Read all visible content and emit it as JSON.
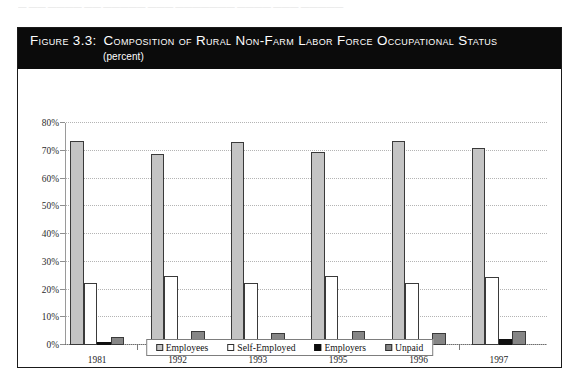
{
  "page": {
    "bleed_text": "—  —— ———— ——  —————  ——— ———————  ———— ———  —————"
  },
  "figure": {
    "label": "Figure 3.3:",
    "title": "Composition of Rural Non-Farm Labor Force Occupational Status",
    "subtitle": "(percent)"
  },
  "legend": {
    "items": [
      {
        "label": "Employees",
        "key": "employees",
        "color": "#c4c4c4"
      },
      {
        "label": "Self-Employed",
        "key": "selfemp",
        "color": "#ffffff"
      },
      {
        "label": "Employers",
        "key": "employers",
        "color": "#0d0d0d"
      },
      {
        "label": "Unpaid",
        "key": "unpaid",
        "color": "#868686"
      }
    ]
  },
  "axis": {
    "y_ticks": [
      "0%",
      "10%",
      "20%",
      "30%",
      "40%",
      "50%",
      "60%",
      "70%",
      "80%"
    ]
  },
  "chart_data": {
    "type": "bar",
    "title": "Composition of Rural Non-Farm Labor Force Occupational Status",
    "subtitle": "(percent)",
    "xlabel": "",
    "ylabel": "",
    "ylim": [
      0,
      80
    ],
    "ytick_step": 10,
    "ytick_labels": [
      "0%",
      "10%",
      "20%",
      "30%",
      "40%",
      "50%",
      "60%",
      "70%",
      "80%"
    ],
    "grid": true,
    "grid_style": "dotted-horizontal",
    "legend_position": "bottom-center",
    "categories": [
      "1981",
      "1992",
      "1993",
      "1995",
      "1996",
      "1997"
    ],
    "series": [
      {
        "name": "Employees",
        "color": "#c4c4c4",
        "values": [
          73.5,
          69.0,
          73.0,
          69.5,
          73.5,
          71.0
        ]
      },
      {
        "name": "Self-Employed",
        "color": "#ffffff",
        "values": [
          22.5,
          25.0,
          22.5,
          25.0,
          22.5,
          24.5
        ]
      },
      {
        "name": "Employers",
        "color": "#0d0d0d",
        "values": [
          1.0,
          1.5,
          1.8,
          2.0,
          1.8,
          2.0
        ]
      },
      {
        "name": "Unpaid",
        "color": "#868686",
        "values": [
          3.0,
          5.0,
          4.5,
          5.0,
          4.5,
          5.0
        ]
      }
    ]
  }
}
